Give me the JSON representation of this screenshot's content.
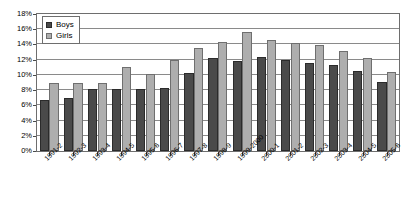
{
  "chart_data": {
    "type": "bar",
    "title": "",
    "xlabel": "",
    "ylabel": "",
    "ylim": [
      0,
      18
    ],
    "y_tick_step": 2,
    "grid": true,
    "legend_position": "top-left-inside",
    "categories": [
      "1991-2",
      "1992-3",
      "1993-4",
      "1994-5",
      "1995-6",
      "1996-7",
      "1997-8",
      "1998-9",
      "1999-2000",
      "2000-1",
      "2001-2",
      "2002-3",
      "2003-4",
      "2004-5",
      "2005-6"
    ],
    "y_tick_labels": [
      "0%",
      "2%",
      "4%",
      "6%",
      "8%",
      "10%",
      "12%",
      "14%",
      "16%",
      "18%"
    ],
    "series": [
      {
        "name": "Boys",
        "color": "#4a4a4a",
        "values": [
          6.7,
          7.0,
          8.1,
          8.2,
          8.2,
          8.3,
          10.2,
          12.2,
          11.8,
          12.3,
          11.9,
          11.6,
          11.3,
          10.5,
          9.1
        ]
      },
      {
        "name": "Girls",
        "color": "#aeaeae",
        "values": [
          9.0,
          9.0,
          8.9,
          11.0,
          10.1,
          12.0,
          13.6,
          14.3,
          15.7,
          14.6,
          14.2,
          13.9,
          13.1,
          12.2,
          10.4
        ]
      }
    ]
  },
  "legend": {
    "items": [
      {
        "label": "Boys"
      },
      {
        "label": "Girls"
      }
    ]
  },
  "colors": {
    "boys": "#4a4a4a",
    "girls": "#aeaeae",
    "gridline": "#8a8a8a",
    "frame": "#6e6e6e",
    "background": "#ffffff"
  }
}
